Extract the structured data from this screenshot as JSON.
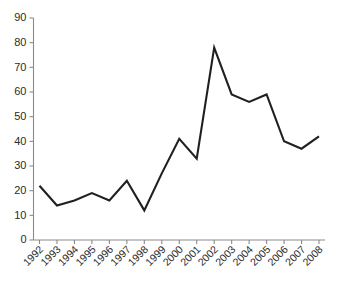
{
  "chart_data": {
    "type": "line",
    "title": "",
    "subtitle": "",
    "xlabel": "",
    "ylabel": "",
    "categories": [
      "1992",
      "1993",
      "1994",
      "1995",
      "1996",
      "1997",
      "1998",
      "1999",
      "2000",
      "2001",
      "2002",
      "2003",
      "2004",
      "2005",
      "2006",
      "2007",
      "2008"
    ],
    "series": [
      {
        "name": "",
        "values": [
          22,
          14,
          16,
          19,
          16,
          24,
          12,
          27,
          41,
          33,
          78,
          59,
          56,
          59,
          40,
          37,
          42
        ]
      }
    ],
    "ylim": [
      0,
      90
    ],
    "ytick_labels": [
      "0",
      "10",
      "20",
      "30",
      "40",
      "50",
      "60",
      "70",
      "80",
      "90"
    ],
    "ytick_values": [
      0,
      10,
      20,
      30,
      40,
      50,
      60,
      70,
      80,
      90
    ],
    "xtick_labels": [
      "1992",
      "1993",
      "1994",
      "1995",
      "1996",
      "1997",
      "1998",
      "1999",
      "2000",
      "2001",
      "2002",
      "2003",
      "2004",
      "2005",
      "2006",
      "2007",
      "2008"
    ],
    "xtick_rotation_deg": -45,
    "grid": false,
    "legend": false,
    "legend_position": "none",
    "colors": {
      "line": "#231f20",
      "axis": "#8a8a8a",
      "text": "#2b2b2b",
      "background": "#ffffff"
    }
  }
}
